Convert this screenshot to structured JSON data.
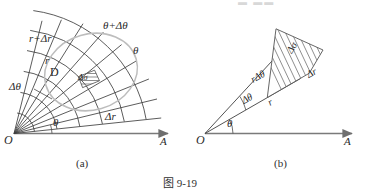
{
  "figure": {
    "caption": "图 9-19",
    "background_color": "#ffffff",
    "ink_color": "#3a3a3a",
    "axis_color": "#7a7a7a",
    "region_curve_color": "#b9b9b9",
    "hatch_color": "#6e6e6e"
  },
  "panel_a": {
    "sublabel": "(a)",
    "origin_label": "O",
    "axis_label": "A",
    "labels": {
      "r_plus_dr": "r+Δr",
      "theta_plus_dtheta": "θ+Δθ",
      "theta": "θ",
      "r": "r",
      "region": "D",
      "d_theta": "Δθ",
      "d_r": "Δr",
      "theta_inner": "θ",
      "d_sigma": "Δσ"
    },
    "grid": {
      "radial_line_count": 9,
      "arc_count": 7,
      "theta_start_deg": 6,
      "theta_end_deg": 62,
      "r_min": 18,
      "r_max": 128
    }
  },
  "panel_b": {
    "sublabel": "(b)",
    "origin_label": "O",
    "axis_label": "A",
    "labels": {
      "d_sigma": "Δσ",
      "d_r": "Δr",
      "r_d_theta": "rΔθ",
      "d_theta": "Δθ",
      "r": "r",
      "theta": "θ"
    },
    "sector": {
      "theta_deg": 30,
      "delta_theta_deg": 17,
      "r_inner": 72,
      "r_outer": 104,
      "hatch_line_count": 15
    }
  },
  "top_artifact": "▬  ▬▬"
}
